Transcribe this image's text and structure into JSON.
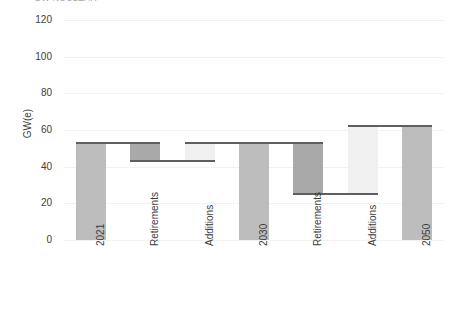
{
  "chart_data": {
    "type": "bar",
    "subtype": "waterfall",
    "title": "GW NUCLEAR",
    "xlabel": "",
    "ylabel": "GW(e)",
    "ylim": [
      0,
      120
    ],
    "yticks": [
      0,
      20,
      40,
      60,
      80,
      100,
      120
    ],
    "grid": true,
    "legend": "none",
    "categories": [
      "2021",
      "Retirements",
      "Additions",
      "2030",
      "Retirements",
      "Additions",
      "2050"
    ],
    "values": [
      53,
      -10,
      10,
      53,
      -28,
      37,
      62
    ],
    "bars": [
      {
        "label": "2021",
        "kind": "total",
        "base": 0,
        "top": 53,
        "value": 53,
        "color": "#bdbdbd"
      },
      {
        "label": "Retirements",
        "kind": "decrease",
        "base": 43,
        "top": 53,
        "value": -10,
        "color": "#a9a9a9"
      },
      {
        "label": "Additions",
        "kind": "increase",
        "base": 43,
        "top": 53,
        "value": 10,
        "color": "#f0f0f0"
      },
      {
        "label": "2030",
        "kind": "total",
        "base": 0,
        "top": 53,
        "value": 53,
        "color": "#bdbdbd"
      },
      {
        "label": "Retirements",
        "kind": "decrease",
        "base": 25,
        "top": 53,
        "value": -28,
        "color": "#a9a9a9"
      },
      {
        "label": "Additions",
        "kind": "increase",
        "base": 25,
        "top": 62,
        "value": 37,
        "color": "#f0f0f0"
      },
      {
        "label": "2050",
        "kind": "total",
        "base": 0,
        "top": 62,
        "value": 62,
        "color": "#bdbdbd"
      }
    ],
    "connectors": [
      {
        "from_bar": 0,
        "level": 53
      },
      {
        "from_bar": 1,
        "level": 43
      },
      {
        "from_bar": 2,
        "level": 53
      },
      {
        "from_bar": 3,
        "level": 53
      },
      {
        "from_bar": 4,
        "level": 25
      },
      {
        "from_bar": 5,
        "level": 62
      }
    ],
    "colors": {
      "total": "#bdbdbd",
      "decrease": "#a9a9a9",
      "increase": "#f0f0f0",
      "connector": "#5f5f5f",
      "gridline": "#f2f2f2",
      "text": "#3d3d3d"
    }
  }
}
